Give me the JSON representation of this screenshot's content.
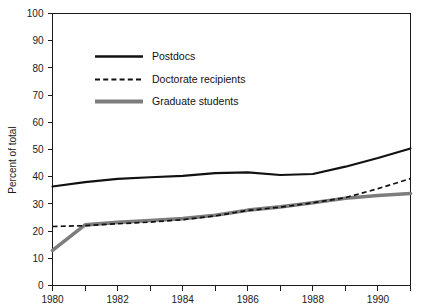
{
  "chart_data": {
    "type": "line",
    "title": "",
    "subtitle": "",
    "xlabel": "",
    "ylabel": "Percent of total",
    "xlim": [
      1980,
      1991
    ],
    "ylim": [
      0,
      100
    ],
    "grid": false,
    "legend_position": "upper-left-inside",
    "x": [
      1980,
      1981,
      1982,
      1983,
      1984,
      1985,
      1986,
      1987,
      1988,
      1989,
      1990,
      1991
    ],
    "x_tick_values": [
      1980,
      1981,
      1982,
      1983,
      1984,
      1985,
      1986,
      1987,
      1988,
      1989,
      1990,
      1991
    ],
    "x_tick_labels": [
      "1980",
      "",
      "1982",
      "",
      "1984",
      "",
      "1986",
      "",
      "1988",
      "",
      "1990",
      ""
    ],
    "y_tick_values": [
      0,
      10,
      20,
      30,
      40,
      50,
      60,
      70,
      80,
      90,
      100
    ],
    "y_tick_labels": [
      "0",
      "10",
      "20",
      "30",
      "40",
      "50",
      "60",
      "70",
      "80",
      "90",
      "100"
    ],
    "series": [
      {
        "name": "Postdocs",
        "style": "solid-thin-black",
        "color": "#111111",
        "values": [
          36.4,
          38.0,
          39.2,
          39.8,
          40.3,
          41.3,
          41.6,
          40.6,
          41.0,
          43.7,
          46.9,
          50.4
        ]
      },
      {
        "name": "Doctorate recipients",
        "style": "dashed-black",
        "color": "#111111",
        "values": [
          21.7,
          22.0,
          22.7,
          23.3,
          24.2,
          25.6,
          27.6,
          28.8,
          30.4,
          32.3,
          35.6,
          39.3
        ]
      },
      {
        "name": "Graduate students",
        "style": "solid-thick-gray",
        "color": "#7d7d7d",
        "values": [
          12.9,
          22.3,
          23.2,
          23.9,
          24.6,
          25.8,
          27.7,
          28.9,
          30.4,
          32.1,
          33.1,
          33.8
        ]
      }
    ]
  },
  "legend": {
    "entries": [
      {
        "label": "Postdocs"
      },
      {
        "label": "Doctorate recipients"
      },
      {
        "label": "Graduate students"
      }
    ]
  },
  "axes": {
    "y_axis_title": "Percent of total"
  }
}
